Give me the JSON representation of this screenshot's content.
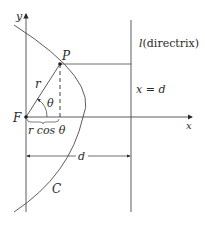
{
  "diagram": {
    "type": "conic-section-polar",
    "labels": {
      "y_axis": "y",
      "x_axis": "x",
      "point": "P",
      "focus": "F",
      "radius": "r",
      "angle": "θ",
      "projection": "r cos θ",
      "directrix_var": "l",
      "directrix_text": "(directrix)",
      "directrix_eq": "x = d",
      "distance": "d",
      "curve": "C"
    },
    "colors": {
      "line": "#4a4a4a",
      "text": "#2a2a2a",
      "background": "#ffffff"
    }
  }
}
